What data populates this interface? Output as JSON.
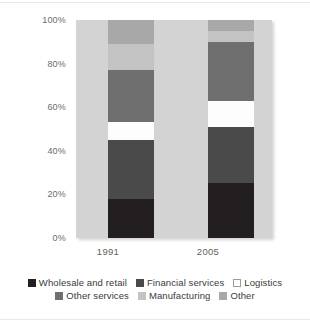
{
  "chart_data": {
    "type": "bar",
    "subtype": "stacked-100-percent",
    "title": "",
    "xlabel": "",
    "ylabel": "",
    "categories": [
      "1991",
      "2005"
    ],
    "ylim": [
      0,
      100
    ],
    "ytick_labels": [
      "100%",
      "80%",
      "60%",
      "40%",
      "20%",
      "0%"
    ],
    "ytick_values": [
      100,
      80,
      60,
      40,
      20,
      0
    ],
    "grid": false,
    "legend_position": "bottom",
    "series": [
      {
        "name": "Wholesale and retail",
        "color": "#231f20",
        "values": [
          18,
          25
        ]
      },
      {
        "name": "Financial services",
        "color": "#4a4a4a",
        "values": [
          27,
          26
        ]
      },
      {
        "name": "Logistics",
        "color": "#fdfdfd",
        "values": [
          8,
          12
        ]
      },
      {
        "name": "Other services",
        "color": "#6f6f6f",
        "values": [
          24,
          27
        ]
      },
      {
        "name": "Manufacturing",
        "color": "#c3c3c3",
        "values": [
          12,
          5
        ]
      },
      {
        "name": "Other",
        "color": "#a8a8a8",
        "values": [
          11,
          5
        ]
      }
    ]
  },
  "axis": {
    "y": [
      {
        "label": "100%",
        "value": 100
      },
      {
        "label": "80%",
        "value": 80
      },
      {
        "label": "60%",
        "value": 60
      },
      {
        "label": "40%",
        "value": 40
      },
      {
        "label": "20%",
        "value": 20
      },
      {
        "label": "0%",
        "value": 0
      }
    ],
    "x": [
      {
        "label": "1991"
      },
      {
        "label": "2005"
      }
    ]
  },
  "legend": {
    "rows": [
      [
        {
          "label": "Wholesale and retail",
          "color": "#231f20",
          "outlined": false
        },
        {
          "label": "Financial services",
          "color": "#4a4a4a",
          "outlined": false
        },
        {
          "label": "Logistics",
          "color": "#ffffff",
          "outlined": true
        }
      ],
      [
        {
          "label": "Other services",
          "color": "#6f6f6f",
          "outlined": false
        },
        {
          "label": "Manufacturing",
          "color": "#c3c3c3",
          "outlined": false
        },
        {
          "label": "Other",
          "color": "#a8a8a8",
          "outlined": false
        }
      ]
    ]
  },
  "colors": {
    "plot_background": "#d3d3d3",
    "page_background": "#ffffff",
    "axis_text": "#6c6c6c",
    "legend_text": "#3a3a3a"
  }
}
